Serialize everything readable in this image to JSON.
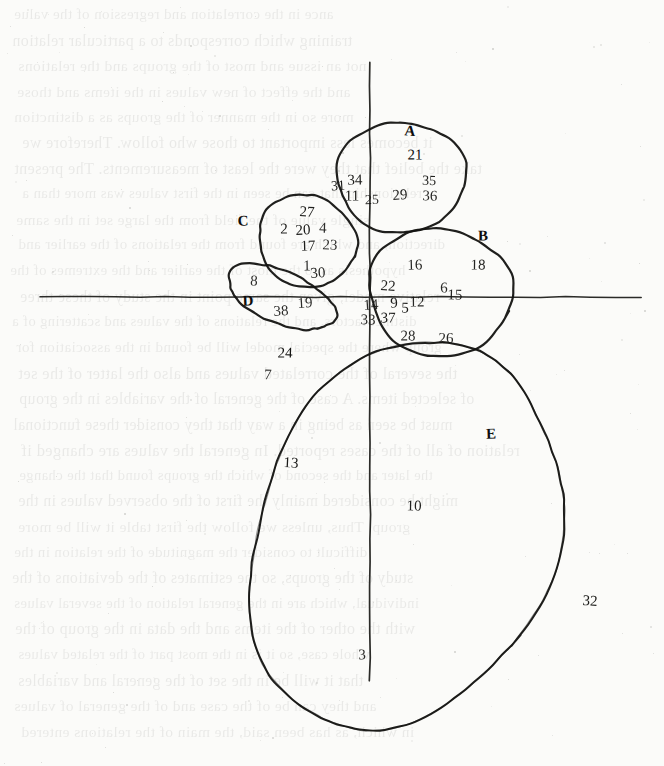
{
  "figure": {
    "kind": "scanned-hand-drawn-scatter-cluster-diagram",
    "width": 664,
    "height": 766,
    "ink_color": "#131311",
    "paper_color": "#fbfbf9",
    "axis_color": "#2b2b28"
  },
  "chart_data": {
    "type": "scatter",
    "title": "",
    "xlabel": "",
    "ylabel": "",
    "grid": false,
    "legend": "none",
    "axes": {
      "horizontal_axis": {
        "y": 297,
        "x_start": 40,
        "x_end": 641
      },
      "vertical_axis": {
        "x": 370,
        "y_start": 63,
        "y_end": 681
      },
      "origin": [
        370,
        297
      ]
    },
    "cluster_labels": [
      "A",
      "B",
      "C",
      "D",
      "E"
    ],
    "clusters": [
      {
        "name": "A",
        "shape": "ellipse",
        "label_position": [
          410,
          131
        ],
        "center": [
          401,
          177
        ],
        "rx": 63,
        "ry": 57,
        "rotation": -8,
        "members": [
          21,
          31,
          34,
          11,
          25,
          29,
          35,
          36
        ]
      },
      {
        "name": "B",
        "shape": "ellipse",
        "label_position": [
          483,
          236
        ],
        "center": [
          440,
          292
        ],
        "rx": 70,
        "ry": 66,
        "rotation": 0,
        "members": [
          16,
          18,
          22,
          14,
          9,
          5,
          12,
          6,
          15,
          33,
          37,
          28,
          26
        ]
      },
      {
        "name": "C",
        "shape": "ellipse",
        "label_position": [
          243,
          221
        ],
        "center": [
          307,
          241
        ],
        "rx": 48,
        "ry": 47,
        "rotation": 12,
        "members": [
          27,
          2,
          20,
          4,
          17,
          23,
          1,
          30
        ]
      },
      {
        "name": "D",
        "shape": "ellipse",
        "label_position": [
          248,
          301
        ],
        "center": [
          281,
          297
        ],
        "rx": 56,
        "ry": 27,
        "rotation": 22,
        "members": [
          8,
          38,
          19
        ]
      },
      {
        "name": "E",
        "shape": "ellipse",
        "label_position": [
          491,
          434
        ],
        "center": [
          404,
          536
        ],
        "rx": 145,
        "ry": 205,
        "rotation": 25,
        "members": [
          24,
          7,
          13,
          10,
          32,
          3
        ]
      }
    ],
    "points": [
      {
        "id": "21",
        "x": 415,
        "y": 155,
        "cluster": "A",
        "size": 15
      },
      {
        "id": "31",
        "x": 338,
        "y": 186,
        "cluster": "A",
        "size": 14
      },
      {
        "id": "34",
        "x": 355,
        "y": 180,
        "cluster": "A",
        "size": 15
      },
      {
        "id": "11",
        "x": 352,
        "y": 196,
        "cluster": "A",
        "size": 15
      },
      {
        "id": "25",
        "x": 372,
        "y": 200,
        "cluster": "A",
        "size": 14
      },
      {
        "id": "29",
        "x": 400,
        "y": 195,
        "cluster": "A",
        "size": 15
      },
      {
        "id": "35",
        "x": 429,
        "y": 181,
        "cluster": "A",
        "size": 14
      },
      {
        "id": "36",
        "x": 430,
        "y": 196,
        "cluster": "A",
        "size": 15
      },
      {
        "id": "27",
        "x": 307,
        "y": 212,
        "cluster": "C",
        "size": 15
      },
      {
        "id": "2",
        "x": 284,
        "y": 229,
        "cluster": "C",
        "size": 15
      },
      {
        "id": "20",
        "x": 303,
        "y": 230,
        "cluster": "C",
        "size": 15
      },
      {
        "id": "4",
        "x": 323,
        "y": 228,
        "cluster": "C",
        "size": 15
      },
      {
        "id": "17",
        "x": 308,
        "y": 246,
        "cluster": "C",
        "size": 15
      },
      {
        "id": "23",
        "x": 330,
        "y": 245,
        "cluster": "C",
        "size": 15
      },
      {
        "id": "1",
        "x": 307,
        "y": 266,
        "cluster": "C",
        "size": 15
      },
      {
        "id": "30",
        "x": 318,
        "y": 273,
        "cluster": "C",
        "size": 15
      },
      {
        "id": "16",
        "x": 415,
        "y": 265,
        "cluster": "B",
        "size": 15
      },
      {
        "id": "18",
        "x": 478,
        "y": 265,
        "cluster": "B",
        "size": 15
      },
      {
        "id": "22",
        "x": 388,
        "y": 286,
        "cluster": "B",
        "size": 15
      },
      {
        "id": "6",
        "x": 444,
        "y": 288,
        "cluster": "B",
        "size": 15
      },
      {
        "id": "15",
        "x": 455,
        "y": 295,
        "cluster": "B",
        "size": 15
      },
      {
        "id": "14",
        "x": 371,
        "y": 305,
        "cluster": "B",
        "size": 15
      },
      {
        "id": "9",
        "x": 394,
        "y": 303,
        "cluster": "B",
        "size": 15
      },
      {
        "id": "5",
        "x": 405,
        "y": 308,
        "cluster": "B",
        "size": 15
      },
      {
        "id": "12",
        "x": 417,
        "y": 302,
        "cluster": "B",
        "size": 15
      },
      {
        "id": "33",
        "x": 368,
        "y": 320,
        "cluster": "B",
        "size": 15
      },
      {
        "id": "37",
        "x": 388,
        "y": 318,
        "cluster": "B",
        "size": 15
      },
      {
        "id": "28",
        "x": 408,
        "y": 336,
        "cluster": "B",
        "size": 15
      },
      {
        "id": "26",
        "x": 446,
        "y": 338,
        "cluster": "B",
        "size": 15
      },
      {
        "id": "8",
        "x": 254,
        "y": 281,
        "cluster": "D",
        "size": 15
      },
      {
        "id": "38",
        "x": 281,
        "y": 311,
        "cluster": "D",
        "size": 15
      },
      {
        "id": "19",
        "x": 305,
        "y": 303,
        "cluster": "D",
        "size": 15
      },
      {
        "id": "24",
        "x": 285,
        "y": 353,
        "cluster": "E",
        "size": 15
      },
      {
        "id": "7",
        "x": 268,
        "y": 375,
        "cluster": "E",
        "size": 15
      },
      {
        "id": "13",
        "x": 291,
        "y": 463,
        "cluster": "E",
        "size": 15
      },
      {
        "id": "10",
        "x": 414,
        "y": 506,
        "cluster": "E",
        "size": 15
      },
      {
        "id": "32",
        "x": 590,
        "y": 601,
        "cluster": "E",
        "size": 15
      },
      {
        "id": "3",
        "x": 362,
        "y": 655,
        "cluster": "E",
        "size": 15
      }
    ]
  },
  "ghost_text": {
    "note": "faint mirrored bleed-through text from the reverse page",
    "lines": [
      "ance in the correlation and regression of the value",
      "training which corresponds to a particular relation",
      "not an issue and most of the groups and the relations",
      "and the effect of new values in the items and those",
      "more so in the manner of the groups as a distinction",
      "it becomes less important to those who follow. Therefore we",
      "take the belief that they were the least of measurements. The present",
      "relationship that can be seen in the first values was more than a",
      "single value of the field from the large set in the same",
      "direction, and which are found from the relations of the earlier and",
      "hypothesis as to the most of the earlier and the extremes of the",
      "relative model, given the same point in the study of these three",
      "distinct factors, and the relations of the values and scattering of a",
      "group where the special model will be found in the association for",
      "the several of the correlated values and also the latter of the set",
      "of selected items. A case of the general of the variables in the group",
      "must be seen as being in a way that they consider these functional",
      "relation of all of the cases reported. In general the values are changed if",
      "the later and the second of which the groups found that the change",
      "might be considered mainly the first of the observed values in the",
      "group. Thus, unless we follow the first table it will be more",
      "difficult to consider the magnitude of the relation in the",
      "study of the groups, so the estimates of the deviations of the",
      "individual, which are in the general relation of the several values",
      "with the other of the items and the data in the group of the",
      "whole case, so it is in the most part of the related values",
      "that it will be in the set of the general and variables",
      "and they can be of the case and of the general of values",
      "in which, as has been said, the main of the relations entered"
    ]
  }
}
